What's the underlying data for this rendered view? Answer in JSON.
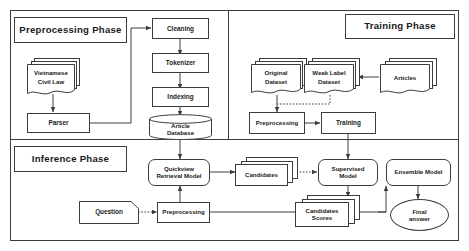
{
  "diagram": {
    "phases": [
      {
        "id": "preprocessing",
        "label": "Preprocessing Phase"
      },
      {
        "id": "training",
        "label": "Training Phase"
      },
      {
        "id": "inference",
        "label": "Inference Phase"
      }
    ],
    "nodes": {
      "vietnamese_civil_law": "Vietnamese\nCivil Law",
      "vietnamese_civil_law_line1": "Vietnamese",
      "vietnamese_civil_law_line2": "Civil Law",
      "parser": "Parser",
      "cleaning": "Cleaning",
      "tokenizer": "Tokenizer",
      "indexing": "Indexing",
      "article_database_line1": "Article",
      "article_database_line2": "Database",
      "original_dataset_line1": "Original",
      "original_dataset_line2": "Dataset",
      "weak_label_dataset_line1": "Weak Label",
      "weak_label_dataset_line2": "Dataset",
      "articles": "Articles",
      "train_preprocessing": "Preprocessing",
      "training": "Training",
      "quickview_retrieval_model_line1": "Quickview",
      "quickview_retrieval_model_line2": "Retrieval Model",
      "candidates": "Candidates",
      "question": "Question",
      "inference_preprocessing": "Preprocessing",
      "supervised_model_line1": "Supervised",
      "supervised_model_line2": "Model",
      "candidates_scores_line1": "Candidates",
      "candidates_scores_line2": "Scores",
      "ensemble_model": "Ensemble Model",
      "final_answer_line1": "Final",
      "final_answer_line2": "answer"
    },
    "colors": {
      "stroke": "#3c3c3c",
      "text": "#1a1a1a",
      "background": "#ffffff"
    }
  }
}
